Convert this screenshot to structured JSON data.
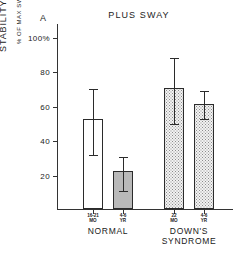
{
  "panel": {
    "label": "A"
  },
  "chart_data": {
    "type": "bar",
    "title": "PLUS SWAY",
    "ylabel": "STABILITY INDEX",
    "ylabel_sub": "% OF MAX SWAY",
    "xlabel": "",
    "ylim": [
      0,
      108
    ],
    "grid": false,
    "legend": "none",
    "ticks": [
      {
        "value": 100,
        "label": "100%"
      },
      {
        "value": 80,
        "label": "80"
      },
      {
        "value": 60,
        "label": "60"
      },
      {
        "value": 40,
        "label": "40"
      },
      {
        "value": 20,
        "label": "20"
      }
    ],
    "categories": [
      "16-21 MO",
      "4-6 YR",
      "22 MO",
      "4-6 YR"
    ],
    "values": [
      52,
      22,
      70,
      61
    ],
    "errors_upper": [
      70,
      31,
      88,
      69
    ],
    "errors_lower": [
      32,
      11,
      50,
      53
    ],
    "fills": [
      "open",
      "gray",
      "stipple",
      "stipple"
    ],
    "groups": [
      {
        "name": "NORMAL",
        "members": [
          "16-21 MO",
          "4-6 YR"
        ]
      },
      {
        "name": "DOWN'S SYNDROME",
        "members": [
          "22 MO",
          "4-6 YR"
        ]
      }
    ],
    "bars": [
      {
        "id": "normal-16-21-mo",
        "line1": "16-21",
        "line2": "MO",
        "value": 52,
        "err_hi": 70,
        "err_lo": 32,
        "fill": "open",
        "group": "NORMAL"
      },
      {
        "id": "normal-4-6-yr",
        "line1": "4-6",
        "line2": "YR",
        "value": 22,
        "err_hi": 31,
        "err_lo": 11,
        "fill": "gray",
        "group": "NORMAL"
      },
      {
        "id": "downs-22-mo",
        "line1": "22",
        "line2": "MO",
        "value": 70,
        "err_hi": 88,
        "err_lo": 50,
        "fill": "stipple",
        "group": "DOWN'S SYNDROME"
      },
      {
        "id": "downs-4-6-yr",
        "line1": "4-6",
        "line2": "YR",
        "value": 61,
        "err_hi": 69,
        "err_lo": 53,
        "fill": "stipple",
        "group": "DOWN'S SYNDROME"
      }
    ],
    "group_labels": [
      {
        "text": "NORMAL",
        "line2": ""
      },
      {
        "text": "DOWN'S",
        "line2": "SYNDROME"
      }
    ],
    "colors": {
      "axis": "#333333",
      "bar_outline": "#2b2b2b",
      "fill_open": "#ffffff",
      "fill_gray": "#b9b9b9",
      "fill_stipple": "#f2f2f2",
      "text": "#1a1a1a",
      "background": "#ffffff"
    }
  }
}
